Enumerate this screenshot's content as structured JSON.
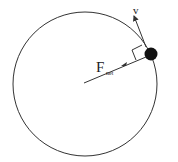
{
  "diagram": {
    "labels": {
      "velocity": "v",
      "force_main": "F",
      "force_sub": "net"
    },
    "colors": {
      "stroke": "#333333",
      "ball": "#111111",
      "background": "#ffffff"
    },
    "elements": [
      "circular-path",
      "ball",
      "velocity-arrow",
      "net-force-arrow",
      "right-angle-marker"
    ]
  }
}
